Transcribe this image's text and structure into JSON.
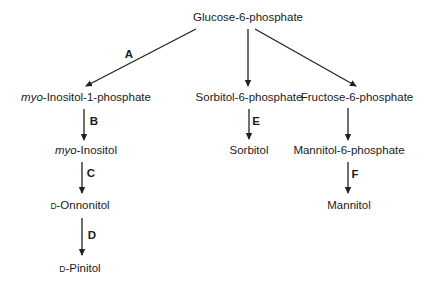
{
  "diagram": {
    "nodes": {
      "glucose6p": {
        "text": "Glucose-6-phosphate"
      },
      "myoInositol1p": {
        "prefix": "myo",
        "text": "-Inositol-1-phosphate"
      },
      "sorbitol6p": {
        "text": "Sorbitol-6-phosphate"
      },
      "fructose6p": {
        "text": "Fructose-6-phosphate"
      },
      "myoInositol": {
        "prefix": "myo",
        "text": "-Inositol"
      },
      "sorbitol": {
        "text": "Sorbitol"
      },
      "mannitol6p": {
        "text": "Mannitol-6-phosphate"
      },
      "dOnonitol": {
        "prefix": "D",
        "text": "-Onnonitol"
      },
      "mannitol": {
        "text": "Mannitol"
      },
      "dPinitol": {
        "prefix": "D",
        "text": "-Pinitol"
      }
    },
    "edges": [
      {
        "from": "glucose6p",
        "to": "myoInositol1p",
        "label": "A"
      },
      {
        "from": "glucose6p",
        "to": "sorbitol6p",
        "label": ""
      },
      {
        "from": "glucose6p",
        "to": "fructose6p",
        "label": ""
      },
      {
        "from": "myoInositol1p",
        "to": "myoInositol",
        "label": "B"
      },
      {
        "from": "myoInositol",
        "to": "dOnonitol",
        "label": "C"
      },
      {
        "from": "dOnonitol",
        "to": "dPinitol",
        "label": "D"
      },
      {
        "from": "sorbitol6p",
        "to": "sorbitol",
        "label": "E"
      },
      {
        "from": "fructose6p",
        "to": "mannitol6p",
        "label": ""
      },
      {
        "from": "mannitol6p",
        "to": "mannitol",
        "label": "F"
      }
    ],
    "colors": {
      "line": "#222222",
      "text": "#1a1a1a",
      "background": "#ffffff"
    }
  }
}
